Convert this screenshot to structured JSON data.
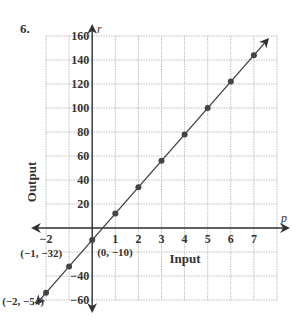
{
  "problem_number": "6.",
  "chart_data": {
    "type": "line",
    "title": "",
    "xlabel": "Input",
    "ylabel": "Output",
    "x_variable": "p",
    "y_variable": "r",
    "xlim": [
      -2,
      8
    ],
    "ylim": [
      -60,
      160
    ],
    "grid": true,
    "x_ticks": [
      -2,
      1,
      2,
      3,
      4,
      5,
      6,
      7
    ],
    "x_tick_labels": [
      "−2",
      "1",
      "2",
      "3",
      "4",
      "5",
      "6",
      "7"
    ],
    "y_ticks": [
      160,
      140,
      120,
      100,
      80,
      60,
      40,
      20,
      -40,
      -60
    ],
    "y_tick_labels": [
      "160",
      "140",
      "120",
      "100",
      "80",
      "60",
      "40",
      "20",
      "−40",
      "−60"
    ],
    "series": [
      {
        "name": "r = 22p − 10",
        "x": [
          -2,
          -1,
          0,
          1,
          2,
          3,
          4,
          5,
          6,
          7
        ],
        "y": [
          -54,
          -32,
          -10,
          12,
          34,
          56,
          78,
          100,
          122,
          144
        ]
      }
    ],
    "annotations": [
      {
        "text": "(−1, −32)",
        "x": -1,
        "y": -32
      },
      {
        "text": "(−2, −54)",
        "x": -2,
        "y": -54
      },
      {
        "text": "(0, −10)",
        "x": 0,
        "y": -10
      }
    ],
    "colors": {
      "line": "#444444",
      "axis": "#333333",
      "grid": "#b0b0b0",
      "point": "#444444"
    }
  }
}
